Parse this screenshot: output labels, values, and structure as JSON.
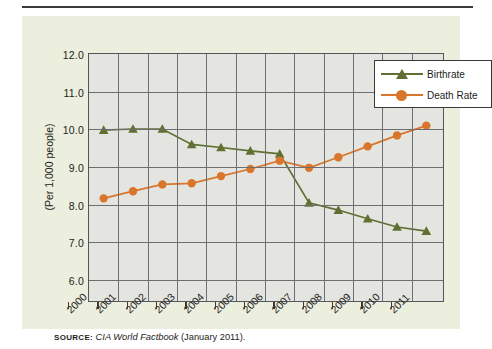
{
  "figure": {
    "y_axis_title": "(Per 1,000 people)",
    "source_label": "Source:",
    "source_italic": "CIA World Factbook",
    "source_rest": " (January 2011)."
  },
  "legend": {
    "position": "top-right",
    "entries": [
      {
        "label": "Birthrate",
        "color": "#5f7032",
        "marker": "triangle"
      },
      {
        "label": "Death Rate",
        "color": "#d9762b",
        "marker": "circle"
      }
    ]
  },
  "colors": {
    "birthrate": "#5f7032",
    "death_rate": "#d9762b",
    "panel": "#eceede",
    "plot_bg": "#e4e5e0",
    "grid": "#6d6e72",
    "axis": "#55565a",
    "text": "#1d1d1b"
  },
  "chart_data": {
    "type": "line",
    "title": "",
    "xlabel": "",
    "ylabel": "(Per 1,000 people)",
    "xlim": [
      2000,
      2012
    ],
    "ylim": [
      5.5,
      12.0
    ],
    "yticks": [
      "12.0",
      "11.0",
      "10.0",
      "9.0",
      "8.0",
      "7.0",
      "6.0"
    ],
    "ytick_values": [
      12.0,
      11.0,
      10.0,
      9.0,
      8.0,
      7.0,
      6.0
    ],
    "xticks": [
      "2000",
      "2001",
      "2002",
      "2003",
      "2004",
      "2005",
      "2006",
      "2007",
      "2008",
      "2009",
      "2010",
      "2011"
    ],
    "xtick_values": [
      2000,
      2001,
      2002,
      2003,
      2004,
      2005,
      2006,
      2007,
      2008,
      2009,
      2010,
      2011
    ],
    "grid": true,
    "x": [
      2000.5,
      2001.5,
      2002.5,
      2003.5,
      2004.5,
      2005.5,
      2006.5,
      2007.5,
      2008.5,
      2009.5,
      2010.5,
      2011.5
    ],
    "series": [
      {
        "name": "Birthrate",
        "color": "#5f7032",
        "marker": "triangle",
        "values": [
          9.98,
          10.01,
          10.01,
          9.6,
          9.52,
          9.43,
          9.35,
          8.05,
          7.86,
          7.63,
          7.41,
          7.3
        ]
      },
      {
        "name": "Death Rate",
        "color": "#d9762b",
        "marker": "circle",
        "values": [
          8.17,
          8.36,
          8.54,
          8.57,
          8.76,
          8.95,
          9.17,
          8.98,
          9.26,
          9.55,
          9.84,
          10.1
        ]
      }
    ],
    "annotations": []
  }
}
